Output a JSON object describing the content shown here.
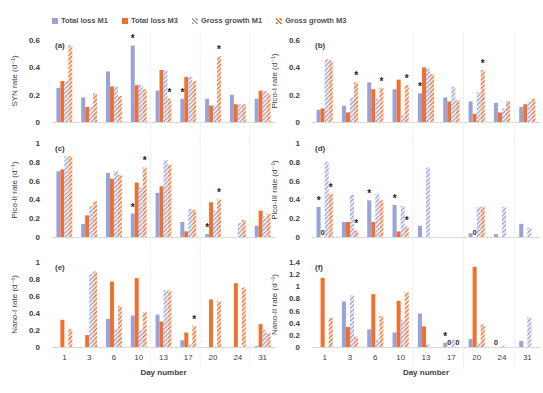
{
  "legend": {
    "items": [
      {
        "label": "Total loss M1",
        "style": "solid",
        "color": "#9aa3d9"
      },
      {
        "label": "Total loss M3",
        "style": "solid",
        "color": "#f07030"
      },
      {
        "label": "Gross growth  M1",
        "style": "hatched",
        "color": "#9aa3d9"
      },
      {
        "label": "Gross growth  M3",
        "style": "hatched",
        "color": "#f07030"
      }
    ]
  },
  "colors": {
    "blue": "#9aa3d9",
    "orange": "#f07030",
    "axis_text": "#404040",
    "grid": "#ececec"
  },
  "chart_data": [
    {
      "type": "bar",
      "panel_label": "(a)",
      "ylabel": "SYN rate (d⁻¹)",
      "xlabel": "",
      "ylim": [
        0,
        0.6
      ],
      "yticks": [
        0,
        0.2,
        0.4,
        0.6
      ],
      "ytick_labels": [
        "0",
        "0.2",
        "0.4",
        "0.6"
      ],
      "categories": [
        "1",
        "3",
        "6",
        "10",
        "13",
        "17",
        "20",
        "24",
        "31"
      ],
      "series": [
        {
          "name": "Total loss M1",
          "values": [
            0.25,
            0.18,
            0.37,
            0.56,
            0.23,
            0.17,
            0.17,
            0.2,
            0.17
          ]
        },
        {
          "name": "Total loss M3",
          "values": [
            0.3,
            0.11,
            0.26,
            0.27,
            0.38,
            0.33,
            0.12,
            0.13,
            0.23
          ]
        },
        {
          "name": "Gross growth M1",
          "values": [
            0.3,
            0.11,
            0.26,
            0.27,
            0.38,
            0.33,
            0.12,
            0.13,
            0.23
          ]
        },
        {
          "name": "Gross growth M3",
          "values": [
            0.56,
            0.21,
            0.19,
            0.24,
            0.17,
            0.3,
            0.48,
            0.13,
            0.21
          ]
        }
      ],
      "annotations": [
        {
          "category": 3,
          "series": 0,
          "text": "*"
        },
        {
          "category": 4,
          "series": 3,
          "text": "*"
        },
        {
          "category": 5,
          "series": 0,
          "text": "*"
        },
        {
          "category": 6,
          "series": 3,
          "text": "*"
        }
      ],
      "grid": false,
      "show_xticks": false
    },
    {
      "type": "bar",
      "panel_label": "(b)",
      "ylabel": "Pico-I rate (d⁻¹)",
      "xlabel": "",
      "ylim": [
        0,
        0.6
      ],
      "yticks": [
        0,
        0.2,
        0.4,
        0.6
      ],
      "ytick_labels": [
        "0",
        "0.2",
        "0.4",
        "0.6"
      ],
      "categories": [
        "1",
        "3",
        "6",
        "10",
        "13",
        "17",
        "20",
        "24",
        "31"
      ],
      "series": [
        {
          "name": "Total loss M1",
          "values": [
            0.09,
            0.12,
            0.29,
            0.24,
            0.21,
            0.18,
            0.15,
            0.14,
            0.11
          ]
        },
        {
          "name": "Total loss M3",
          "values": [
            0.1,
            0.07,
            0.24,
            0.31,
            0.4,
            0.15,
            0.06,
            0.07,
            0.13
          ]
        },
        {
          "name": "Gross growth M1",
          "values": [
            0.46,
            0.18,
            0.17,
            0.05,
            0.39,
            0.26,
            0.22,
            0.1,
            0.15
          ]
        },
        {
          "name": "Gross growth M3",
          "values": [
            0.45,
            0.29,
            0.25,
            0.27,
            0.35,
            0.16,
            0.38,
            0.15,
            0.17
          ]
        }
      ],
      "annotations": [
        {
          "category": 1,
          "series": 3,
          "text": "*"
        },
        {
          "category": 2,
          "series": 3,
          "text": "*"
        },
        {
          "category": 3,
          "series": 3,
          "text": "*"
        },
        {
          "category": 4,
          "series": 0,
          "text": "*"
        },
        {
          "category": 6,
          "series": 3,
          "text": "*"
        }
      ],
      "grid": false,
      "show_xticks": false
    },
    {
      "type": "bar",
      "panel_label": "(c)",
      "ylabel": "Pico-II rate (d⁻¹)",
      "xlabel": "",
      "ylim": [
        0,
        1.0
      ],
      "yticks": [
        0,
        0.2,
        0.4,
        0.6,
        0.8,
        1.0
      ],
      "ytick_labels": [
        "0",
        "0.2",
        "0.4",
        "0.6",
        "0.8",
        "1"
      ],
      "categories": [
        "1",
        "3",
        "6",
        "10",
        "13",
        "17",
        "20",
        "24",
        "31"
      ],
      "series": [
        {
          "name": "Total loss M1",
          "values": [
            0.7,
            0.14,
            0.68,
            0.25,
            0.47,
            0.16,
            0.03,
            0,
            0.12
          ]
        },
        {
          "name": "Total loss M3",
          "values": [
            0.72,
            0.23,
            0.62,
            0.58,
            0.54,
            0.06,
            0.37,
            0,
            0.28
          ]
        },
        {
          "name": "Gross growth M1",
          "values": [
            0.86,
            0.33,
            0.7,
            0.53,
            0.82,
            0.3,
            0.28,
            0.15,
            0.22
          ]
        },
        {
          "name": "Gross growth M3",
          "values": [
            0.86,
            0.38,
            0.66,
            0.74,
            0.77,
            0.29,
            0.4,
            0.18,
            0.25
          ]
        }
      ],
      "annotations": [
        {
          "category": 3,
          "series": 0,
          "text": "*"
        },
        {
          "category": 3,
          "series": 3,
          "text": "*"
        },
        {
          "category": 6,
          "series": 0,
          "text": "*"
        },
        {
          "category": 6,
          "series": 3,
          "text": "*"
        }
      ],
      "grid": false,
      "show_xticks": false
    },
    {
      "type": "bar",
      "panel_label": "(d)",
      "ylabel": "Pico-III rate (d⁻¹)",
      "xlabel": "",
      "ylim": [
        0,
        1.0
      ],
      "yticks": [
        0,
        0.2,
        0.4,
        0.6,
        0.8,
        1.0
      ],
      "ytick_labels": [
        "0",
        "0.2",
        "0.4",
        "0.6",
        "0.8",
        "1"
      ],
      "categories": [
        "1",
        "3",
        "6",
        "10",
        "13",
        "17",
        "20",
        "24",
        "31"
      ],
      "series": [
        {
          "name": "Total loss M1",
          "values": [
            0.32,
            0.16,
            0.39,
            0.34,
            0.12,
            0,
            0.04,
            0.03,
            0.14
          ]
        },
        {
          "name": "Total loss M3",
          "values": [
            0,
            0.16,
            0.16,
            0.06,
            0,
            0,
            0,
            0,
            0
          ]
        },
        {
          "name": "Gross growth M1",
          "values": [
            0.8,
            0.45,
            0.46,
            0.33,
            0.74,
            0,
            0.32,
            0.32,
            0.1
          ]
        },
        {
          "name": "Gross growth M3",
          "values": [
            0.46,
            0.07,
            0.39,
            0.11,
            0,
            0,
            0.32,
            0,
            0
          ]
        }
      ],
      "annotations": [
        {
          "category": 0,
          "series": 0,
          "text": "*"
        },
        {
          "category": 0,
          "series": 3,
          "text": "*"
        },
        {
          "category": 0,
          "series": 1,
          "text": "0"
        },
        {
          "category": 1,
          "series": 3,
          "text": "*"
        },
        {
          "category": 2,
          "series": 0,
          "text": "*"
        },
        {
          "category": 3,
          "series": 0,
          "text": "*"
        },
        {
          "category": 3,
          "series": 3,
          "text": "*"
        },
        {
          "category": 6,
          "series": 1,
          "text": "0"
        }
      ],
      "grid": false,
      "show_xticks": false
    },
    {
      "type": "bar",
      "panel_label": "(e)",
      "ylabel": "Nano-I rate (d⁻¹)",
      "xlabel": "Day number",
      "ylim": [
        0,
        1.0
      ],
      "yticks": [
        0,
        0.2,
        0.4,
        0.6,
        0.8,
        1.0
      ],
      "ytick_labels": [
        "0",
        "0.2",
        "0.4",
        "0.6",
        "0.8",
        "1"
      ],
      "categories": [
        "1",
        "3",
        "6",
        "10",
        "13",
        "17",
        "20",
        "24",
        "31"
      ],
      "series": [
        {
          "name": "Total loss M1",
          "values": [
            0,
            0,
            0.33,
            0.37,
            0.38,
            0.08,
            0,
            0,
            0.01
          ]
        },
        {
          "name": "Total loss M3",
          "values": [
            0.32,
            0.14,
            0.77,
            0.81,
            0.3,
            0.17,
            0.56,
            0.75,
            0.27
          ]
        },
        {
          "name": "Gross growth M1",
          "values": [
            0,
            0.86,
            0.21,
            0.2,
            0.67,
            0.03,
            0,
            0,
            0.2
          ]
        },
        {
          "name": "Gross growth M3",
          "values": [
            0.21,
            0.89,
            0.48,
            0.41,
            0.66,
            0.25,
            0.54,
            0.7,
            0.16
          ]
        }
      ],
      "annotations": [
        {
          "category": 5,
          "series": 3,
          "text": "*"
        }
      ],
      "grid": false,
      "show_xticks": true
    },
    {
      "type": "bar",
      "panel_label": "(f)",
      "ylabel": "Nano-II rate (d⁻¹)",
      "xlabel": "Day number",
      "ylim": [
        0,
        1.4
      ],
      "yticks": [
        0,
        0.2,
        0.4,
        0.6,
        0.8,
        1.0,
        1.2,
        1.4
      ],
      "ytick_labels": [
        "0",
        "0.2",
        "0.4",
        "0.6",
        "0.8",
        "1",
        "1.2",
        "1.4"
      ],
      "categories": [
        "1",
        "3",
        "6",
        "10",
        "13",
        "17",
        "20",
        "24",
        "31"
      ],
      "series": [
        {
          "name": "Total loss M1",
          "values": [
            0,
            0.75,
            0.29,
            0.24,
            0.55,
            0.07,
            0.13,
            0,
            0.1
          ]
        },
        {
          "name": "Total loss M3",
          "values": [
            1.14,
            0.33,
            0.87,
            0.76,
            0.34,
            0,
            1.32,
            0,
            0
          ]
        },
        {
          "name": "Gross growth M1",
          "values": [
            0,
            0.85,
            0.12,
            0.44,
            0.04,
            0.12,
            0.07,
            0.02,
            0.49
          ]
        },
        {
          "name": "Gross growth M3",
          "values": [
            0.48,
            0.17,
            0.51,
            0.9,
            0,
            0,
            0.37,
            0,
            0
          ]
        }
      ],
      "annotations": [
        {
          "category": 5,
          "series": 0,
          "text": "*"
        },
        {
          "category": 5,
          "series": 1,
          "text": "0"
        },
        {
          "category": 5,
          "series": 3,
          "text": "0"
        },
        {
          "category": 7,
          "series": 0,
          "text": "0"
        }
      ],
      "grid": false,
      "show_xticks": true
    }
  ]
}
